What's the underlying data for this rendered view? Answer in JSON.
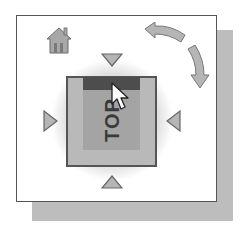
{
  "widget": {
    "name": "ViewCube",
    "face_label": "TOP",
    "icons": {
      "home": "home-icon",
      "rotate_ccw": "rotate-arrow-left-icon",
      "rotate_cw": "rotate-arrow-down-icon",
      "arrow_up": "triangle-down-icon",
      "arrow_down": "triangle-up-icon",
      "arrow_left": "triangle-right-icon",
      "arrow_right": "triangle-left-icon",
      "cursor": "mouse-pointer-icon"
    },
    "colors": {
      "panel_bg": "#ffffff",
      "panel_border": "#555555",
      "shadow": "#bdbdbd",
      "cube_frame": "#b9b9b9",
      "cube_face": "#a4a4a4",
      "face_band": "#4d4d4d",
      "arrow_fill": "#b5b5b5",
      "arrow_stroke": "#666666"
    }
  }
}
